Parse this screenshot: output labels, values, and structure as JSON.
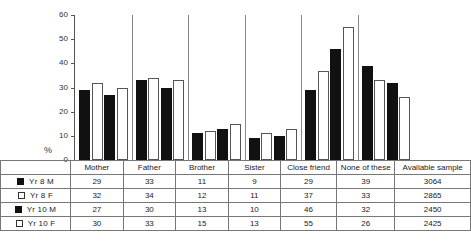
{
  "chart_data": {
    "type": "bar",
    "title": "",
    "xlabel": "",
    "ylabel": "%",
    "ylim": [
      0,
      60
    ],
    "yticks": [
      0,
      10,
      20,
      30,
      40,
      50,
      60
    ],
    "grid": false,
    "legend_position": "table-left",
    "categories": [
      "Mother",
      "Father",
      "Brother",
      "Sister",
      "Close friend",
      "None of these"
    ],
    "series": [
      {
        "name": "Yr 8 M",
        "swatch": "filled",
        "values": [
          29,
          33,
          11,
          9,
          29,
          39
        ],
        "available_sample": "3064"
      },
      {
        "name": "Yr 8 F",
        "swatch": "hollow",
        "values": [
          32,
          34,
          12,
          11,
          37,
          33
        ],
        "available_sample": "2865"
      },
      {
        "name": "Yr 10 M",
        "swatch": "filled",
        "values": [
          27,
          30,
          13,
          10,
          46,
          32
        ],
        "available_sample": "2450"
      },
      {
        "name": "Yr 10 F",
        "swatch": "hollow",
        "values": [
          30,
          33,
          15,
          13,
          55,
          26
        ],
        "available_sample": "2425"
      }
    ],
    "available_sample_header": "Available sample"
  },
  "colors": {
    "filled_bar": "#111111",
    "hollow_bar": "#ffffff",
    "bar_outline": "#555555",
    "axis": "#555555",
    "table_border": "#777777"
  }
}
